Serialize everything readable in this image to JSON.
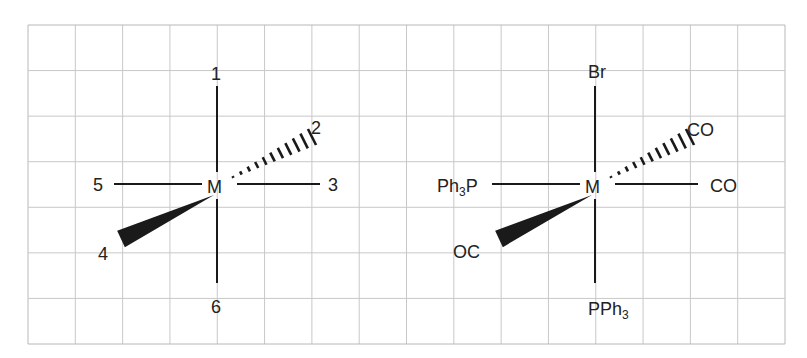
{
  "grid": {
    "left": 28,
    "top": 25,
    "right": 785,
    "bottom": 344,
    "columns": 16,
    "rows": 7,
    "line_color": "#c8c8c8",
    "border_color": "#b8b8b8"
  },
  "diagrams": [
    {
      "name": "generic-octahedral",
      "center": {
        "x": 217,
        "y": 186
      },
      "metal": "M",
      "positions": {
        "top": "1",
        "hashed_wedge": "2",
        "right": "3",
        "solid_wedge": "4",
        "left": "5",
        "bottom": "6"
      }
    },
    {
      "name": "complex-octahedral",
      "center": {
        "x": 595,
        "y": 186
      },
      "metal": "M",
      "ligands": {
        "top": "Br",
        "hashed_wedge": "CO",
        "right": "CO",
        "solid_wedge": "OC",
        "left_main": "Ph",
        "left_sub": "3",
        "left_tail": "P",
        "bottom_main": "PPh",
        "bottom_sub": "3"
      }
    }
  ],
  "colors": {
    "ink": "#1a1a1a",
    "grid": "#c8c8c8"
  }
}
